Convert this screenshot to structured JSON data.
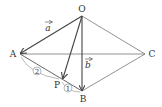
{
  "points": {
    "O": {
      "label": "O",
      "x": 82,
      "y": 16
    },
    "A": {
      "label": "A",
      "x": 20,
      "y": 54
    },
    "B": {
      "label": "B",
      "x": 82,
      "y": 91
    },
    "C": {
      "label": "C",
      "x": 145,
      "y": 54
    },
    "P": {
      "label": "P",
      "x": 62,
      "y": 79
    }
  },
  "vectors": {
    "a": {
      "label": "a",
      "from": "O",
      "to": "A"
    },
    "b": {
      "label": "b",
      "from": "O",
      "to": "B"
    },
    "p": {
      "from": "O",
      "to": "P"
    }
  },
  "ratio": {
    "AP": "2",
    "PB": "1"
  },
  "colors": {
    "line": "#444444",
    "thin": "#777777"
  }
}
